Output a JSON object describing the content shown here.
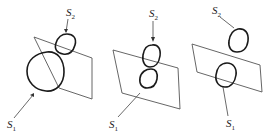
{
  "figure": {
    "panels": [
      {
        "id": "panel-1",
        "labels": {
          "s1": "S",
          "s1_sub": "1",
          "s2": "S",
          "s2_sub": "2"
        },
        "note": "S1 large loop intersecting plane, S2 small loop overlapping S1 at top"
      },
      {
        "id": "panel-2",
        "labels": {
          "s1": "S",
          "s1_sub": "1",
          "s2": "S",
          "s2_sub": "2"
        },
        "note": "S1 and S2 two stacked loops both crossing the plane"
      },
      {
        "id": "panel-3",
        "labels": {
          "s1": "S",
          "s1_sub": "1",
          "s2": "S",
          "s2_sub": "2"
        },
        "note": "S2 loop separated above plane, S1 loop crossing plane"
      }
    ],
    "colors": {
      "loop": "#1a1a1a",
      "plane": "#555555",
      "text": "#222222"
    }
  }
}
